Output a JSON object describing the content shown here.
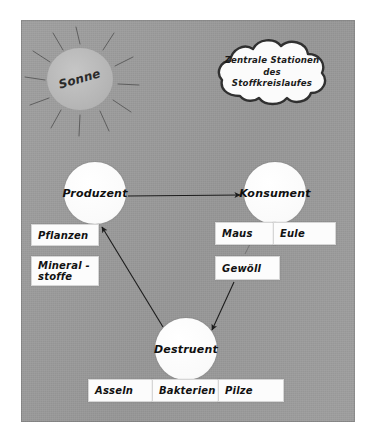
{
  "poster": {
    "title_cloud": "Zentrale Stationen\ndes Stoffkreislaufes",
    "sun_label": "Sonne"
  },
  "nodes": [
    {
      "id": "produzent",
      "label": "Produzent"
    },
    {
      "id": "konsument",
      "label": "Konsument"
    },
    {
      "id": "destruent",
      "label": "Destruent"
    }
  ],
  "cards": {
    "pflanzen": "Pflanzen",
    "mineralstoffe": "Mineral -\nstoffe",
    "maus": "Maus",
    "eule": "Eule",
    "gewoell": "Gewöll",
    "asseln": "Asseln",
    "bakterien": "Bakterien",
    "pilze": "Pilze"
  },
  "connections": [
    {
      "from": "produzent",
      "to": "konsument",
      "style": "arrow"
    },
    {
      "from": "destruent",
      "to": "produzent",
      "style": "arrow"
    },
    {
      "from": "gewoell",
      "to": "destruent",
      "style": "arrow"
    },
    {
      "from": "konsument",
      "to": "maus",
      "style": "thin-line"
    },
    {
      "from": "destruent",
      "to": "bakterien",
      "style": "thin-line"
    }
  ],
  "colors": {
    "board_background": "#9d9d9d",
    "card_background": "#fcfcfc",
    "node_background": "#fdfdfd",
    "sun_fill": "#b9b9b9",
    "ink": "#1b1b1b"
  }
}
